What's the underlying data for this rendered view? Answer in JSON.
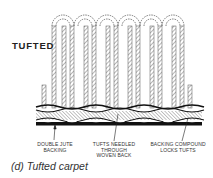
{
  "figure": {
    "main_label": "TUFTED",
    "callouts": [
      {
        "line1": "DOUBLE JUTE",
        "line2": "BACKING",
        "line3": ""
      },
      {
        "line1": "TUFTS NEEDLED",
        "line2": "THROUGH",
        "line3": "WOVEN BACK"
      },
      {
        "line1": "BACKING COMPOUND",
        "line2": "LOCKS TUFTS",
        "line3": ""
      }
    ],
    "caption": "(d)  Tufted  carpet",
    "loop_count": 6
  }
}
